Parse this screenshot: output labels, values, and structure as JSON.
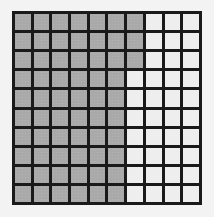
{
  "diagram": {
    "type": "hundred-grid",
    "rows": 10,
    "columns": 10,
    "total_cells": 100,
    "shaded_count": 63,
    "unshaded_count": 37,
    "shaded_per_row": [
      7,
      7,
      7,
      6,
      6,
      6,
      6,
      6,
      6,
      6
    ],
    "colors": {
      "shaded": "#a9a9a9",
      "unshaded": "#eeeeee",
      "grid_lines": "#1a1a1a",
      "background": "#f3f3f3"
    }
  }
}
